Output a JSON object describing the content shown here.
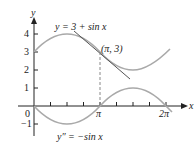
{
  "figure": {
    "y_axis_label": "y",
    "x_axis_label": "x",
    "y_ticks": [
      {
        "label": "4",
        "value": 4
      },
      {
        "label": "3",
        "value": 3
      },
      {
        "label": "2",
        "value": 2
      },
      {
        "label": "1",
        "value": 1
      },
      {
        "label": "0",
        "value": 0
      },
      {
        "label": "−1",
        "value": -1
      }
    ],
    "x_ticks": [
      {
        "label": "π",
        "value": 3.14159
      },
      {
        "label": "2π",
        "value": 6.28318
      }
    ],
    "curve_label": "y = 3 + sin x",
    "second_derivative_label": "y″ = −sin x",
    "point_label": "(π, 3)",
    "colors": {
      "curve": "#a9a9a9",
      "tangent": "#555555",
      "axis": "#222222",
      "dashed": "#888888"
    }
  }
}
